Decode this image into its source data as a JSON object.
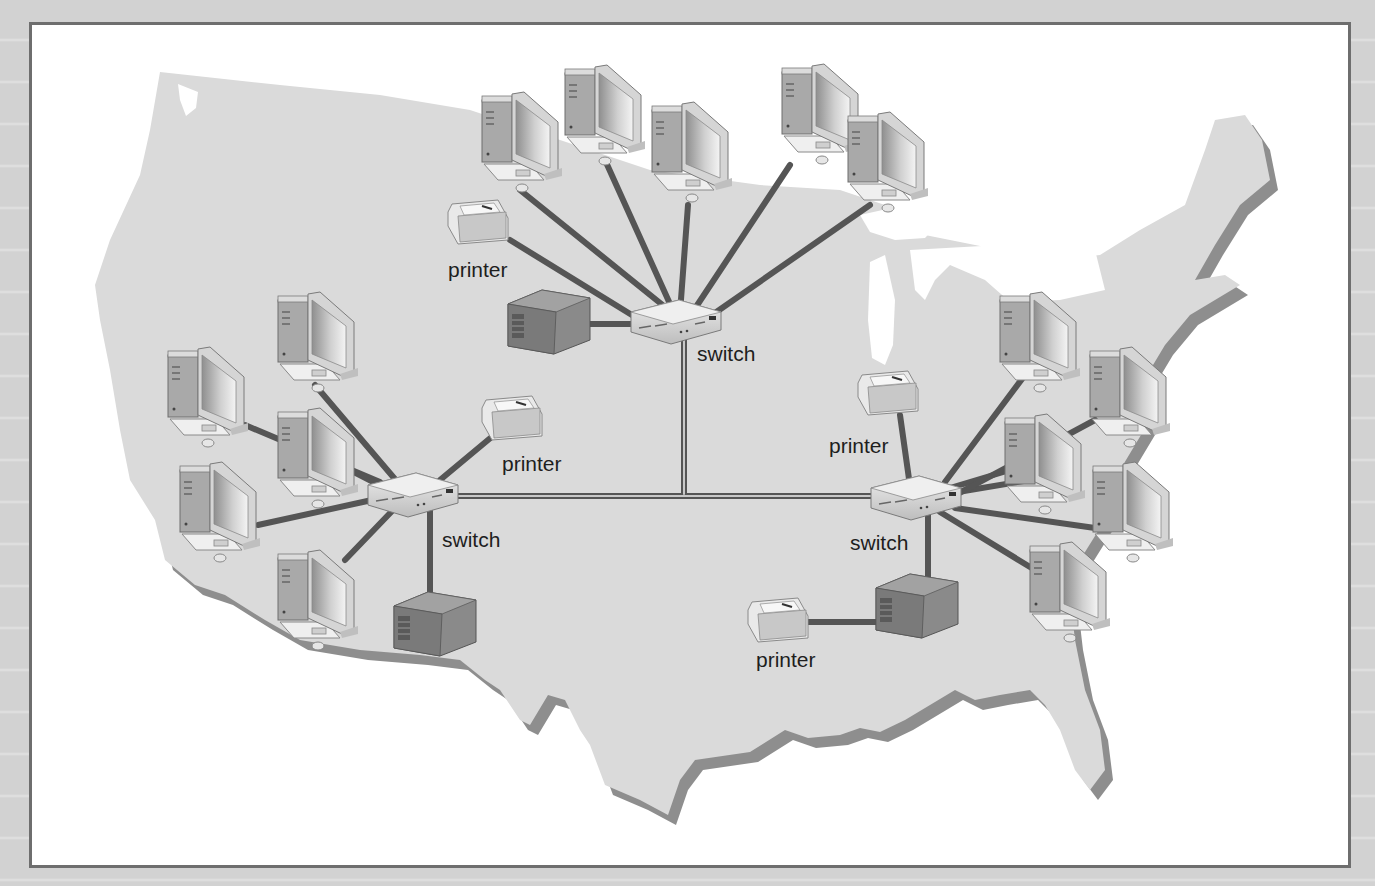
{
  "figure": {
    "type": "network-diagram",
    "colors": {
      "background": "#d4d4d4",
      "frame_border": "#6e6e6e",
      "frame_fill": "#ffffff",
      "map_fill": "#d9d9d9",
      "map_shadow": "#8c8c8c",
      "cable": "#555555",
      "label": "#1e1e1e"
    }
  },
  "labels": {
    "switch_center": "switch",
    "switch_west": "switch",
    "switch_east": "switch",
    "printer_center": "printer",
    "printer_west": "printer",
    "printer_east_top": "printer",
    "printer_east_bottom": "printer"
  },
  "nodes": {
    "switches": [
      {
        "id": "switch-center",
        "x": 675,
        "y": 320
      },
      {
        "id": "switch-west",
        "x": 412,
        "y": 493
      },
      {
        "id": "switch-east",
        "x": 915,
        "y": 496
      }
    ],
    "servers": [
      {
        "id": "server-center",
        "x": 545,
        "y": 320,
        "links_to": "switch-center"
      },
      {
        "id": "server-west",
        "x": 432,
        "y": 620,
        "links_to": "switch-west"
      },
      {
        "id": "server-east",
        "x": 915,
        "y": 600,
        "links_to": "switch-east"
      }
    ],
    "printers": [
      {
        "id": "printer-center",
        "x": 476,
        "y": 222,
        "links_to": "switch-center"
      },
      {
        "id": "printer-west",
        "x": 512,
        "y": 418,
        "links_to": "switch-west"
      },
      {
        "id": "printer-east-top",
        "x": 888,
        "y": 393,
        "links_to": "switch-east"
      },
      {
        "id": "printer-east-bottom",
        "x": 777,
        "y": 620,
        "links_to": "server-east"
      }
    ],
    "workstations": [
      {
        "id": "pc-c1",
        "x": 522,
        "y": 140,
        "links_to": "switch-center"
      },
      {
        "id": "pc-c2",
        "x": 603,
        "y": 115,
        "links_to": "switch-center"
      },
      {
        "id": "pc-c3",
        "x": 690,
        "y": 150,
        "links_to": "switch-center"
      },
      {
        "id": "pc-c4",
        "x": 820,
        "y": 112,
        "links_to": "switch-center"
      },
      {
        "id": "pc-c5",
        "x": 885,
        "y": 160,
        "links_to": "switch-center"
      },
      {
        "id": "pc-w1",
        "x": 318,
        "y": 335,
        "links_to": "switch-west"
      },
      {
        "id": "pc-w2",
        "x": 208,
        "y": 390,
        "links_to": "switch-west"
      },
      {
        "id": "pc-w3",
        "x": 318,
        "y": 450,
        "links_to": "switch-west"
      },
      {
        "id": "pc-w4",
        "x": 218,
        "y": 505,
        "links_to": "switch-west"
      },
      {
        "id": "pc-w5",
        "x": 318,
        "y": 595,
        "links_to": "switch-west"
      },
      {
        "id": "pc-e1",
        "x": 1040,
        "y": 335,
        "links_to": "switch-east"
      },
      {
        "id": "pc-e2",
        "x": 1130,
        "y": 390,
        "links_to": "switch-east"
      },
      {
        "id": "pc-e3",
        "x": 1045,
        "y": 455,
        "links_to": "switch-east"
      },
      {
        "id": "pc-e4",
        "x": 1133,
        "y": 505,
        "links_to": "switch-east"
      },
      {
        "id": "pc-e5",
        "x": 1070,
        "y": 585,
        "links_to": "switch-east"
      }
    ]
  },
  "backbone": [
    {
      "from": "switch-center",
      "to": "backbone-junction",
      "x1": 684,
      "y1": 325,
      "x2": 684,
      "y2": 494
    },
    {
      "from": "switch-west",
      "to": "switch-east",
      "x1": 455,
      "y1": 494,
      "x2": 875,
      "y2": 494
    }
  ]
}
